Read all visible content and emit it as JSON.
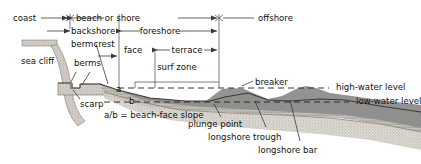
{
  "diagram": {
    "type": "cross-section",
    "zones": {
      "coast": "coast",
      "beach_or_shore": "beach or shore",
      "offshore": "offshore",
      "backshore": "backshore",
      "foreshore": "foreshore",
      "face": "face",
      "terrace": "terrace",
      "surf_zone": "surf zone"
    },
    "features": {
      "sea_cliff": "sea cliff",
      "bermcrest": "bermcrest",
      "berms": "berms",
      "scarp": "scarp",
      "breaker": "breaker",
      "plunge_point": "plunge point",
      "longshore_trough": "longshore trough",
      "longshore_bar": "longshore bar"
    },
    "levels": {
      "high_water": "high-water level",
      "low_water": "low-water level"
    },
    "slope": {
      "a": "a",
      "b": "b",
      "formula": "a/b = beach-face slope"
    },
    "colors": {
      "water": "#8d8d8d",
      "sediment": "#c9c7c2",
      "bedrock": "#ded9d2",
      "line": "#3a3a3a",
      "text": "#111111",
      "background": "#ffffff"
    }
  }
}
